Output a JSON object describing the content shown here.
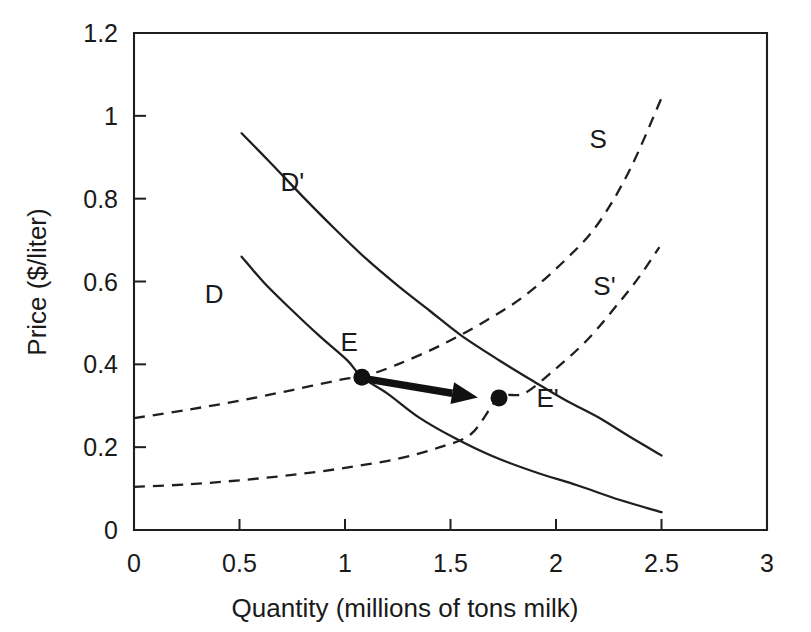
{
  "chart_data": {
    "type": "line",
    "title": "",
    "xlabel": "Quantity (millions of tons milk)",
    "ylabel": "Price ($/liter)",
    "xlim": [
      0,
      3
    ],
    "ylim": [
      0,
      1.2
    ],
    "xticks": [
      "0",
      "0.5",
      "1",
      "1.5",
      "2",
      "2.5",
      "3"
    ],
    "xtick_values": [
      0,
      0.5,
      1,
      1.5,
      2,
      2.5,
      3
    ],
    "yticks": [
      "0",
      "0.2",
      "0.4",
      "0.6",
      "0.8",
      "1",
      "1.2"
    ],
    "ytick_values": [
      0,
      0.2,
      0.4,
      0.6,
      0.8,
      1,
      1.2
    ],
    "grid": false,
    "legend": "inline-curve-labels",
    "series": [
      {
        "name": "D",
        "label": "D",
        "style": "solid",
        "label_x": 0.38,
        "label_y": 0.57,
        "points": [
          [
            0.51,
            0.66
          ],
          [
            0.62,
            0.595
          ],
          [
            0.75,
            0.53
          ],
          [
            0.88,
            0.468
          ],
          [
            1.01,
            0.41
          ],
          [
            1.08,
            0.369
          ],
          [
            1.2,
            0.33
          ],
          [
            1.35,
            0.272
          ],
          [
            1.52,
            0.222
          ],
          [
            1.7,
            0.178
          ],
          [
            1.9,
            0.14
          ],
          [
            2.1,
            0.108
          ],
          [
            2.3,
            0.073
          ],
          [
            2.5,
            0.043
          ]
        ]
      },
      {
        "name": "D'",
        "label": "D'",
        "style": "solid",
        "label_x": 0.75,
        "label_y": 0.84,
        "points": [
          [
            0.51,
            0.958
          ],
          [
            0.65,
            0.885
          ],
          [
            0.8,
            0.805
          ],
          [
            0.95,
            0.728
          ],
          [
            1.1,
            0.655
          ],
          [
            1.25,
            0.59
          ],
          [
            1.4,
            0.53
          ],
          [
            1.55,
            0.47
          ],
          [
            1.73,
            0.41
          ],
          [
            1.9,
            0.357
          ],
          [
            2.05,
            0.312
          ],
          [
            2.2,
            0.272
          ],
          [
            2.35,
            0.225
          ],
          [
            2.5,
            0.18
          ]
        ]
      },
      {
        "name": "S",
        "label": "S",
        "style": "dashed",
        "label_x": 2.2,
        "label_y": 0.945,
        "points": [
          [
            0.0,
            0.27
          ],
          [
            0.25,
            0.29
          ],
          [
            0.5,
            0.312
          ],
          [
            0.75,
            0.338
          ],
          [
            1.0,
            0.365
          ],
          [
            1.08,
            0.369
          ],
          [
            1.25,
            0.4
          ],
          [
            1.45,
            0.445
          ],
          [
            1.65,
            0.5
          ],
          [
            1.85,
            0.565
          ],
          [
            2.05,
            0.655
          ],
          [
            2.2,
            0.74
          ],
          [
            2.35,
            0.87
          ],
          [
            2.5,
            1.043
          ]
        ]
      },
      {
        "name": "S'",
        "label": "S'",
        "style": "dashed",
        "label_x": 2.23,
        "label_y": 0.59,
        "points": [
          [
            0.0,
            0.104
          ],
          [
            0.25,
            0.11
          ],
          [
            0.5,
            0.12
          ],
          [
            0.75,
            0.133
          ],
          [
            1.0,
            0.15
          ],
          [
            1.25,
            0.172
          ],
          [
            1.45,
            0.2
          ],
          [
            1.6,
            0.233
          ],
          [
            1.73,
            0.319
          ],
          [
            1.85,
            0.33
          ],
          [
            2.0,
            0.39
          ],
          [
            2.15,
            0.46
          ],
          [
            2.3,
            0.55
          ],
          [
            2.4,
            0.615
          ],
          [
            2.49,
            0.683
          ]
        ]
      }
    ],
    "annotations": [
      {
        "name": "equilibrium-E",
        "label": "E",
        "x": 1.08,
        "y": 0.369,
        "label_x": 1.02,
        "label_y": 0.455,
        "marker": "filled-circle"
      },
      {
        "name": "equilibrium-E-prime",
        "label": "E'",
        "x": 1.73,
        "y": 0.319,
        "label_x": 1.96,
        "label_y": 0.318,
        "marker": "filled-circle"
      },
      {
        "name": "shift-arrow",
        "label": "",
        "from_x": 1.1,
        "from_y": 0.365,
        "to_x": 1.63,
        "to_y": 0.32,
        "marker": "arrow"
      }
    ]
  }
}
